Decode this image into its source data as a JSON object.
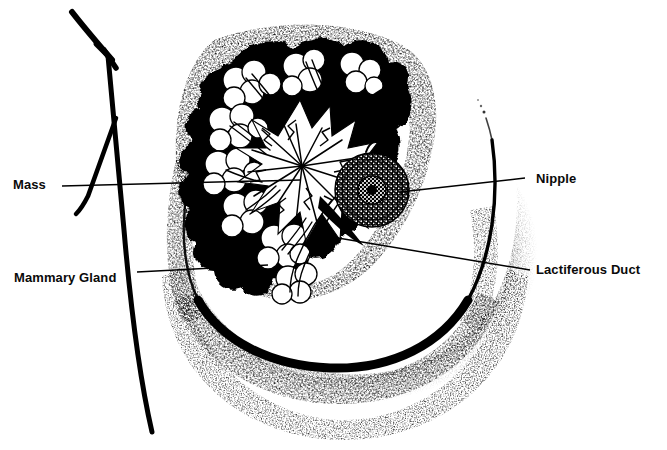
{
  "figure": {
    "background_color": "#ffffff",
    "ink_color": "#000000",
    "width": 667,
    "height": 450
  },
  "labels": [
    {
      "id": "mass",
      "text": "Mass",
      "side": "left",
      "text_x": 13,
      "text_y": 178,
      "leader": {
        "x1": 62,
        "y1": 186,
        "x2": 300,
        "y2": 180
      }
    },
    {
      "id": "mammary_gland",
      "text": "Mammary Gland",
      "side": "left",
      "text_x": 14,
      "text_y": 271,
      "leader": {
        "x1": 137,
        "y1": 272,
        "x2": 268,
        "y2": 265
      }
    },
    {
      "id": "nipple",
      "text": "Nipple",
      "side": "right",
      "text_x": 536,
      "text_y": 172,
      "leader": {
        "x1": 525,
        "y1": 178,
        "x2": 400,
        "y2": 192
      }
    },
    {
      "id": "lactiferous_duct",
      "text": "Lactiferous Duct",
      "side": "right",
      "text_x": 536,
      "text_y": 263,
      "leader": {
        "x1": 530,
        "y1": 270,
        "x2": 338,
        "y2": 238
      }
    }
  ],
  "structures": {
    "chest_wall": {
      "name": "chest wall line",
      "note": "Heavy hand-drawn vertical line with a branching arrow-like fork at top"
    },
    "breast_outline": {
      "name": "breast contour",
      "note": "Thick stippled arc sweeping from upper-left down around to upper-right"
    },
    "nipple": {
      "name": "nipple and areola",
      "center_x": 372,
      "center_y": 190,
      "outer_radius": 37,
      "inner_radius": 14
    },
    "mass": {
      "name": "spiculated mass",
      "center_x": 300,
      "center_y": 160,
      "note": "Radiating white spicules surrounded by dark lobular glandular tissue"
    },
    "mammary_gland": {
      "name": "mammary gland lobules",
      "note": "Grape-like clusters of lobules filling the upper and left region"
    },
    "lactiferous_duct": {
      "name": "lactiferous duct",
      "note": "Fine duct lines converging from the lobules toward the nipple"
    }
  }
}
